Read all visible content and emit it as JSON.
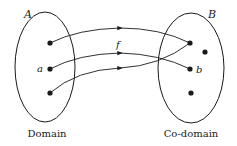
{
  "diagram": {
    "type": "function-mapping",
    "function_label": "f",
    "domain": {
      "set_label": "A",
      "caption": "Domain",
      "element_labels": [
        "",
        "a",
        ""
      ]
    },
    "codomain": {
      "set_label": "B",
      "caption": "Co-domain",
      "element_labels": [
        "",
        "",
        "b",
        ""
      ]
    },
    "mappings": [
      {
        "from": 0,
        "to": 0
      },
      {
        "from": 1,
        "to": 2
      },
      {
        "from": 2,
        "to": 0
      }
    ],
    "colors": {
      "stroke": "#1a1a1a",
      "background": "#ffffff"
    }
  }
}
